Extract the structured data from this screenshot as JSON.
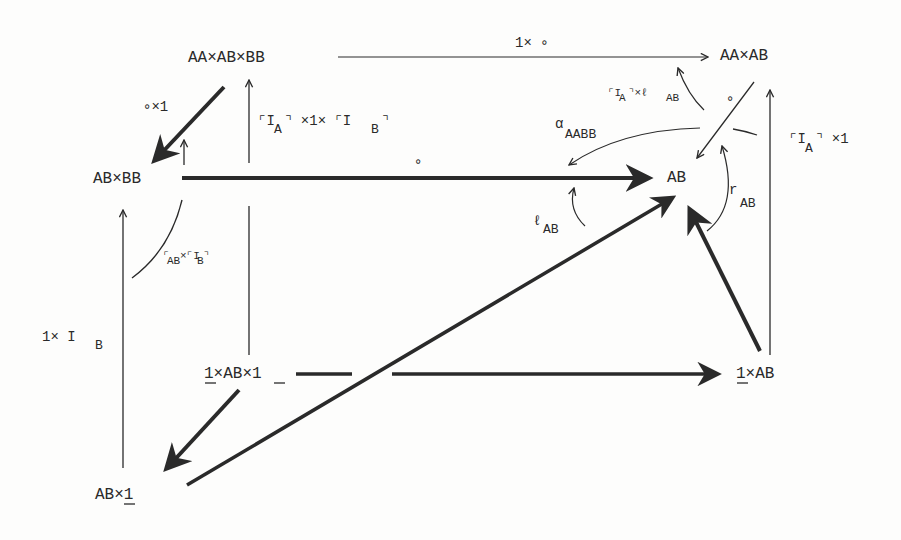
{
  "diagram": {
    "type": "commutative-diagram",
    "nodes": {
      "aaabbb": "AA×AB×BB",
      "aaab": "AA×AB",
      "abbb": "AB×BB",
      "ab": "AB",
      "one_ab_one": "1×AB×1",
      "one_ab": "1×AB",
      "ab_one": "AB×1"
    },
    "edges": {
      "top": "1× ∘",
      "comp_x1": "∘×1",
      "ia_1_ib_main": "⌜I",
      "ia_1_ib_sub_a": "A",
      "ia_1_ib_mid": "⌝ ×1× ⌜I",
      "ia_1_ib_sub_b": "B",
      "ia_1_ib_end": "⌝",
      "compose_mid": "∘",
      "compose_right": "∘",
      "ia_x_lab_main": "⌜I",
      "ia_x_lab_sub_a": "A",
      "ia_x_lab_mid": "⌝×ℓ",
      "ia_x_lab_sub_ab": "AB",
      "alpha": "α",
      "alpha_sub": "AABB",
      "ia_x1_main": "⌜I",
      "ia_x1_sub": "A",
      "ia_x1_end": "⌝ ×1",
      "lab": "ℓ",
      "lab_sub": "AB",
      "rab": "r",
      "rab_sub": "AB",
      "rab_ib_main": "⌜",
      "rab_ib_sub": "AB",
      "rab_ib_mid": "×⌜I",
      "rab_ib_sub_b": "B",
      "rab_ib_end": "⌝",
      "one_ib_main": "1× I",
      "one_ib_sub": "B"
    },
    "colors": {
      "ink": "#2a2a2a",
      "background": "#fdfdfc"
    }
  }
}
